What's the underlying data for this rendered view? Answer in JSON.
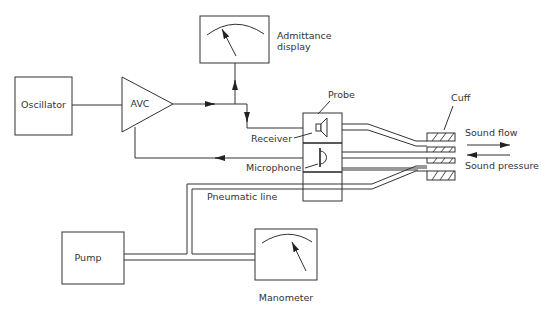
{
  "diagram": {
    "components": {
      "oscillator": "Oscillator",
      "avc": "AVC",
      "admittance_display": [
        "Admittance",
        "display"
      ],
      "probe": "Probe",
      "receiver": "Receiver",
      "microphone": "Microphone",
      "cuff": "Cuff",
      "sound_flow": "Sound flow",
      "sound_pressure": "Sound pressure",
      "pneumatic_line": "Pneumatic line",
      "pump": "Pump",
      "manometer": "Manometer"
    },
    "connections": [
      {
        "from": "Oscillator",
        "to": "AVC"
      },
      {
        "from": "AVC",
        "to": "Admittance display"
      },
      {
        "from": "AVC",
        "to": "Receiver"
      },
      {
        "from": "Microphone",
        "to": "AVC"
      },
      {
        "from": "Pump",
        "to": "Pneumatic line"
      },
      {
        "from": "Pump",
        "to": "Manometer"
      },
      {
        "from": "Pneumatic line",
        "to": "Probe"
      },
      {
        "from": "Probe",
        "to": "Cuff"
      }
    ]
  }
}
